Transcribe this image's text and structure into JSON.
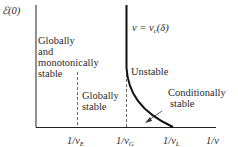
{
  "diagram": {
    "y_axis_label": "ℰ(0)",
    "x_axis_label": "1/v",
    "curve_label": "v = v",
    "curve_label_sub": "c",
    "curve_label_tail": "(δ)",
    "regions": {
      "globally_monotonic": [
        "Globally",
        "and",
        "monotonically",
        "stable"
      ],
      "globally_stable": [
        "Globally",
        "stable"
      ],
      "unstable": "Unstable",
      "conditionally_stable": [
        "Conditionally",
        "stable"
      ]
    },
    "ticks": [
      {
        "pre": "1/v",
        "sub": "E"
      },
      {
        "pre": "1/v",
        "sub": "G"
      },
      {
        "pre": "1/v",
        "sub": "L"
      }
    ],
    "colors": {
      "axis": "#222222",
      "curve": "#111111",
      "dashed": "#444444"
    }
  }
}
